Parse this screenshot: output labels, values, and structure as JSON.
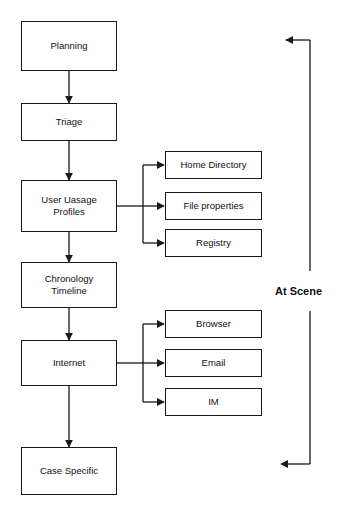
{
  "diagram": {
    "type": "flowchart",
    "background_color": "#ffffff",
    "line_color": "#1a1a1a",
    "text_color": "#111111",
    "main_flow": [
      {
        "id": "planning",
        "label": "Planning"
      },
      {
        "id": "triage",
        "label": "Triage"
      },
      {
        "id": "user-usage-profiles",
        "label": "User Uasage\nProfiles"
      },
      {
        "id": "chronology-timeline",
        "label": "Chronology\nTimeline"
      },
      {
        "id": "internet",
        "label": "Internet"
      },
      {
        "id": "case-specific",
        "label": "Case Specific"
      }
    ],
    "branches": [
      {
        "from": "user-usage-profiles",
        "items": [
          {
            "id": "home-directory",
            "label": "Home Directory"
          },
          {
            "id": "file-properties",
            "label": "File properties"
          },
          {
            "id": "registry",
            "label": "Registry"
          }
        ]
      },
      {
        "from": "internet",
        "items": [
          {
            "id": "browser",
            "label": "Browser"
          },
          {
            "id": "email",
            "label": "Email"
          },
          {
            "id": "im",
            "label": "IM"
          }
        ]
      }
    ],
    "annotations": [
      {
        "id": "at-scene",
        "label": "At Scene"
      }
    ]
  }
}
